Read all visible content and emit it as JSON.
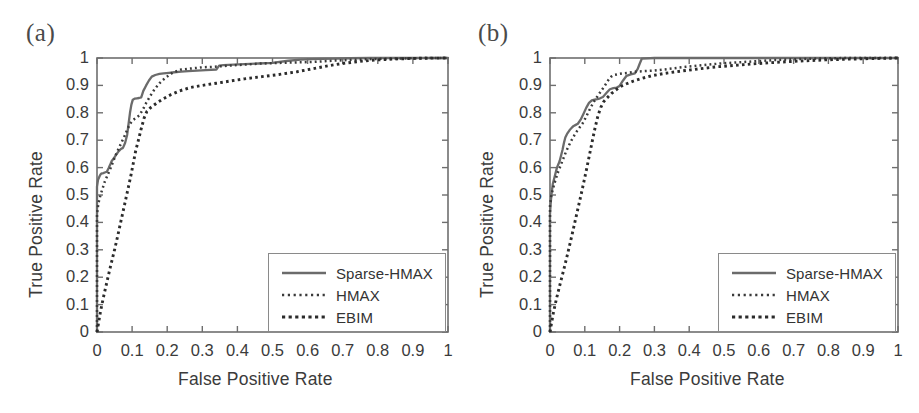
{
  "figure": {
    "width": 919,
    "height": 413,
    "background": "#ffffff",
    "panels": [
      {
        "tag": "(a)",
        "xlabel": "False Positive Rate",
        "ylabel": "True Positive Rate"
      },
      {
        "tag": "(b)",
        "xlabel": "False Positive Rate",
        "ylabel": "True Positive Rate"
      }
    ]
  },
  "axis": {
    "xticks": [
      "0",
      "0.1",
      "0.2",
      "0.3",
      "0.4",
      "0.5",
      "0.6",
      "0.7",
      "0.8",
      "0.9",
      "1"
    ],
    "yticks": [
      "0",
      "0.1",
      "0.2",
      "0.3",
      "0.4",
      "0.5",
      "0.6",
      "0.7",
      "0.8",
      "0.9",
      "1"
    ],
    "xlim": [
      0,
      1
    ],
    "ylim": [
      0,
      1
    ],
    "grid": false,
    "axis_color": "#6e6e6e"
  },
  "legend": {
    "position": "lower-right",
    "entries": [
      {
        "label": "Sparse-HMAX",
        "style": "solid",
        "color": "#6b6b6b"
      },
      {
        "label": "HMAX",
        "style": "fine-dotted",
        "color": "#3a3a3a"
      },
      {
        "label": "EBIM",
        "style": "coarse-dotted",
        "color": "#2b2b2b"
      }
    ]
  },
  "chart_data": [
    {
      "type": "line",
      "title": "(a)",
      "xlabel": "False Positive Rate",
      "ylabel": "True Positive Rate",
      "xlim": [
        0,
        1
      ],
      "ylim": [
        0,
        1
      ],
      "grid": false,
      "legend_position": "lower-right",
      "series": [
        {
          "name": "Sparse-HMAX",
          "style": "solid",
          "color": "#6b6b6b",
          "x": [
            0.0,
            0.0,
            0.003,
            0.008,
            0.01,
            0.012,
            0.018,
            0.022,
            0.028,
            0.033,
            0.038,
            0.042,
            0.048,
            0.055,
            0.062,
            0.068,
            0.074,
            0.08,
            0.086,
            0.09,
            0.094,
            0.098,
            0.102,
            0.108,
            0.114,
            0.12,
            0.126,
            0.132,
            0.14,
            0.148,
            0.156,
            0.166,
            0.178,
            0.19,
            0.205,
            0.22,
            0.24,
            0.26,
            0.285,
            0.31,
            0.34,
            0.348,
            0.36,
            0.39,
            0.42,
            0.46,
            0.5,
            0.545,
            0.58,
            0.61,
            0.64,
            0.68,
            0.72,
            0.78,
            0.84,
            0.9,
            0.96,
            1.0
          ],
          "y": [
            0.0,
            0.53,
            0.556,
            0.57,
            0.575,
            0.578,
            0.58,
            0.582,
            0.585,
            0.598,
            0.612,
            0.624,
            0.634,
            0.648,
            0.66,
            0.668,
            0.672,
            0.69,
            0.72,
            0.76,
            0.8,
            0.83,
            0.848,
            0.852,
            0.853,
            0.854,
            0.856,
            0.88,
            0.9,
            0.918,
            0.932,
            0.938,
            0.942,
            0.944,
            0.946,
            0.948,
            0.95,
            0.952,
            0.954,
            0.956,
            0.958,
            0.972,
            0.974,
            0.976,
            0.978,
            0.98,
            0.982,
            0.99,
            0.994,
            0.996,
            0.997,
            0.998,
            0.999,
            1.0,
            1.0,
            1.0,
            1.0,
            1.0
          ]
        },
        {
          "name": "HMAX",
          "style": "fine-dotted",
          "color": "#3a3a3a",
          "x": [
            0.0,
            0.0,
            0.004,
            0.01,
            0.016,
            0.022,
            0.03,
            0.038,
            0.046,
            0.054,
            0.062,
            0.07,
            0.078,
            0.086,
            0.094,
            0.104,
            0.112,
            0.12,
            0.13,
            0.14,
            0.152,
            0.164,
            0.178,
            0.195,
            0.215,
            0.24,
            0.27,
            0.3,
            0.335,
            0.375,
            0.42,
            0.47,
            0.52,
            0.57,
            0.62,
            0.67,
            0.72,
            0.78,
            0.84,
            0.9,
            0.95,
            1.0
          ],
          "y": [
            0.0,
            0.43,
            0.47,
            0.5,
            0.524,
            0.548,
            0.572,
            0.596,
            0.622,
            0.648,
            0.67,
            0.692,
            0.714,
            0.738,
            0.76,
            0.775,
            0.782,
            0.79,
            0.81,
            0.836,
            0.862,
            0.886,
            0.908,
            0.928,
            0.946,
            0.958,
            0.962,
            0.966,
            0.968,
            0.972,
            0.976,
            0.98,
            0.982,
            0.984,
            0.986,
            0.99,
            0.993,
            0.996,
            0.998,
            0.999,
            1.0,
            1.0
          ]
        },
        {
          "name": "EBIM",
          "style": "coarse-dotted",
          "color": "#2b2b2b",
          "x": [
            0.0,
            0.004,
            0.01,
            0.018,
            0.026,
            0.034,
            0.042,
            0.05,
            0.058,
            0.066,
            0.074,
            0.082,
            0.09,
            0.098,
            0.104,
            0.11,
            0.118,
            0.126,
            0.134,
            0.142,
            0.152,
            0.162,
            0.175,
            0.19,
            0.21,
            0.235,
            0.265,
            0.3,
            0.34,
            0.38,
            0.42,
            0.47,
            0.52,
            0.57,
            0.62,
            0.66,
            0.7,
            0.75,
            0.8,
            0.86,
            0.92,
            1.0
          ],
          "y": [
            0.0,
            0.03,
            0.075,
            0.125,
            0.17,
            0.215,
            0.258,
            0.3,
            0.345,
            0.392,
            0.438,
            0.485,
            0.532,
            0.58,
            0.62,
            0.66,
            0.7,
            0.742,
            0.78,
            0.805,
            0.818,
            0.828,
            0.84,
            0.852,
            0.866,
            0.88,
            0.892,
            0.9,
            0.908,
            0.916,
            0.924,
            0.932,
            0.94,
            0.95,
            0.962,
            0.972,
            0.98,
            0.988,
            0.993,
            0.997,
            0.999,
            1.0
          ]
        }
      ]
    },
    {
      "type": "line",
      "title": "(b)",
      "xlabel": "False Positive Rate",
      "ylabel": "True Positive Rate",
      "xlim": [
        0,
        1
      ],
      "ylim": [
        0,
        1
      ],
      "grid": false,
      "legend_position": "lower-right",
      "series": [
        {
          "name": "Sparse-HMAX",
          "style": "solid",
          "color": "#6b6b6b",
          "x": [
            0.0,
            0.0,
            0.002,
            0.004,
            0.006,
            0.008,
            0.012,
            0.016,
            0.02,
            0.024,
            0.028,
            0.032,
            0.036,
            0.04,
            0.044,
            0.05,
            0.056,
            0.062,
            0.068,
            0.074,
            0.08,
            0.088,
            0.096,
            0.104,
            0.112,
            0.12,
            0.128,
            0.136,
            0.144,
            0.152,
            0.162,
            0.172,
            0.182,
            0.192,
            0.2,
            0.21,
            0.22,
            0.232,
            0.244,
            0.252,
            0.258,
            0.264,
            0.3,
            0.36,
            0.44,
            0.52,
            0.62,
            0.72,
            0.84,
            1.0
          ],
          "y": [
            0.0,
            0.43,
            0.47,
            0.5,
            0.52,
            0.54,
            0.56,
            0.58,
            0.6,
            0.612,
            0.625,
            0.645,
            0.665,
            0.69,
            0.71,
            0.725,
            0.736,
            0.745,
            0.752,
            0.756,
            0.76,
            0.775,
            0.796,
            0.818,
            0.836,
            0.845,
            0.848,
            0.85,
            0.853,
            0.858,
            0.872,
            0.886,
            0.89,
            0.892,
            0.898,
            0.918,
            0.935,
            0.94,
            0.944,
            0.96,
            0.98,
            0.998,
            1.0,
            1.0,
            1.0,
            1.0,
            1.0,
            1.0,
            1.0,
            1.0
          ]
        },
        {
          "name": "HMAX",
          "style": "fine-dotted",
          "color": "#3a3a3a",
          "x": [
            0.0,
            0.0,
            0.004,
            0.01,
            0.016,
            0.022,
            0.03,
            0.038,
            0.046,
            0.054,
            0.062,
            0.07,
            0.078,
            0.086,
            0.094,
            0.104,
            0.114,
            0.124,
            0.134,
            0.146,
            0.158,
            0.168,
            0.176,
            0.184,
            0.192,
            0.2,
            0.21,
            0.225,
            0.245,
            0.27,
            0.3,
            0.34,
            0.39,
            0.44,
            0.49,
            0.54,
            0.59,
            0.64,
            0.69,
            0.74,
            0.8,
            0.86,
            0.92,
            1.0
          ],
          "y": [
            0.0,
            0.46,
            0.5,
            0.53,
            0.556,
            0.58,
            0.606,
            0.632,
            0.658,
            0.68,
            0.7,
            0.718,
            0.734,
            0.748,
            0.762,
            0.786,
            0.812,
            0.836,
            0.856,
            0.878,
            0.9,
            0.92,
            0.932,
            0.938,
            0.94,
            0.942,
            0.944,
            0.946,
            0.95,
            0.952,
            0.954,
            0.96,
            0.968,
            0.974,
            0.98,
            0.984,
            0.988,
            0.992,
            0.995,
            0.997,
            0.999,
            1.0,
            1.0,
            1.0
          ]
        },
        {
          "name": "EBIM",
          "style": "coarse-dotted",
          "color": "#2b2b2b",
          "x": [
            0.0,
            0.004,
            0.01,
            0.018,
            0.026,
            0.034,
            0.042,
            0.05,
            0.058,
            0.066,
            0.074,
            0.082,
            0.09,
            0.098,
            0.106,
            0.114,
            0.122,
            0.13,
            0.138,
            0.146,
            0.154,
            0.162,
            0.17,
            0.178,
            0.186,
            0.196,
            0.206,
            0.22,
            0.24,
            0.265,
            0.295,
            0.33,
            0.375,
            0.425,
            0.48,
            0.54,
            0.6,
            0.66,
            0.72,
            0.79,
            0.86,
            0.93,
            1.0
          ],
          "y": [
            0.0,
            0.03,
            0.072,
            0.118,
            0.16,
            0.2,
            0.24,
            0.282,
            0.325,
            0.37,
            0.415,
            0.46,
            0.505,
            0.552,
            0.6,
            0.65,
            0.7,
            0.748,
            0.79,
            0.82,
            0.84,
            0.852,
            0.862,
            0.872,
            0.88,
            0.89,
            0.898,
            0.906,
            0.916,
            0.926,
            0.936,
            0.944,
            0.952,
            0.96,
            0.968,
            0.974,
            0.98,
            0.985,
            0.989,
            0.993,
            0.996,
            0.998,
            1.0
          ]
        }
      ]
    }
  ]
}
